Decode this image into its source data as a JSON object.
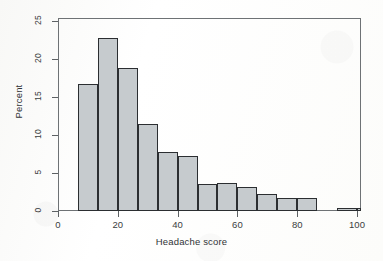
{
  "chart_data": {
    "type": "bar",
    "title": "",
    "xlabel": "Headache score",
    "ylabel": "Percent",
    "xlim": [
      0,
      100
    ],
    "ylim": [
      0,
      25
    ],
    "grid": false,
    "legend": null,
    "bin_width": 6.7,
    "xticks": [
      "0",
      "20",
      "40",
      "60",
      "80",
      "100"
    ],
    "xtick_values": [
      0,
      20,
      40,
      60,
      80,
      100
    ],
    "yticks": [
      "0",
      "5",
      "10",
      "15",
      "20",
      "25"
    ],
    "ytick_values": [
      0,
      5,
      10,
      15,
      20,
      25
    ],
    "bins": [
      {
        "x0": 6.7,
        "x1": 13.3,
        "value": 16.7
      },
      {
        "x0": 13.3,
        "x1": 20.0,
        "value": 22.8
      },
      {
        "x0": 20.0,
        "x1": 26.7,
        "value": 18.8
      },
      {
        "x0": 26.7,
        "x1": 33.3,
        "value": 11.4
      },
      {
        "x0": 33.3,
        "x1": 40.0,
        "value": 7.8
      },
      {
        "x0": 40.0,
        "x1": 46.7,
        "value": 7.3
      },
      {
        "x0": 46.7,
        "x1": 53.3,
        "value": 3.6
      },
      {
        "x0": 53.3,
        "x1": 60.0,
        "value": 3.7
      },
      {
        "x0": 60.0,
        "x1": 66.7,
        "value": 3.2
      },
      {
        "x0": 66.7,
        "x1": 73.3,
        "value": 2.2
      },
      {
        "x0": 73.3,
        "x1": 80.0,
        "value": 1.7
      },
      {
        "x0": 80.0,
        "x1": 86.7,
        "value": 1.7
      },
      {
        "x0": 93.3,
        "x1": 100.0,
        "value": 0.4
      },
      {
        "x0": 100.0,
        "x1": 106.7,
        "value": 0.4
      }
    ],
    "categories": [
      "6.7-13.3",
      "13.3-20",
      "20-26.7",
      "26.7-33.3",
      "33.3-40",
      "40-46.7",
      "46.7-53.3",
      "53.3-60",
      "60-66.7",
      "66.7-73.3",
      "73.3-80",
      "80-86.7",
      "93.3-100",
      "100-106.7"
    ],
    "values": [
      16.7,
      22.8,
      18.8,
      11.4,
      7.8,
      7.3,
      3.6,
      3.7,
      3.2,
      2.2,
      1.7,
      1.7,
      0.4,
      0.4
    ],
    "colors": {
      "bar_fill": "#c6cbce",
      "bar_edge": "#2b2e31",
      "axis": "#5d6164",
      "text": "#303336",
      "background": "#ffffff"
    }
  }
}
